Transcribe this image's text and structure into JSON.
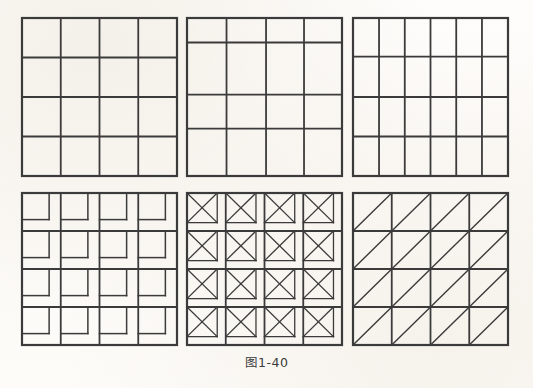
{
  "figure": {
    "caption": "图1-40",
    "background_color": "#fdfcfa",
    "line_color": "#3b3b3b",
    "panel_count": 6
  },
  "panels": [
    {
      "id": "panel-1",
      "name": "uniform-4x4-grid",
      "position": "top-left",
      "x": 22,
      "y": 18,
      "width": 155,
      "height": 158,
      "type": "grid",
      "columns": 4,
      "rows": 4,
      "col_fractions": [
        0.25,
        0.25,
        0.25,
        0.25
      ],
      "row_fractions": [
        0.25,
        0.25,
        0.25,
        0.25
      ],
      "cell_motif": "none",
      "border_width": 2.2,
      "inner_width": 1.8
    },
    {
      "id": "panel-2",
      "name": "irregular-4x4-grid",
      "position": "top-middle",
      "x": 187,
      "y": 18,
      "width": 155,
      "height": 158,
      "type": "grid",
      "columns": 4,
      "rows": 4,
      "col_fractions": [
        0.255,
        0.255,
        0.245,
        0.245
      ],
      "row_fractions": [
        0.155,
        0.33,
        0.215,
        0.3
      ],
      "cell_motif": "none",
      "border_width": 2.2,
      "inner_width": 1.8
    },
    {
      "id": "panel-3",
      "name": "six-column-4-row-grid",
      "position": "top-right",
      "x": 353,
      "y": 18,
      "width": 155,
      "height": 158,
      "type": "grid",
      "columns": 6,
      "rows": 4,
      "col_fractions": [
        0.168,
        0.166,
        0.166,
        0.166,
        0.166,
        0.168
      ],
      "row_fractions": [
        0.245,
        0.255,
        0.25,
        0.25
      ],
      "cell_motif": "none",
      "border_width": 2.2,
      "inner_width": 1.8
    },
    {
      "id": "panel-4",
      "name": "nested-square-spiral-grid",
      "position": "bottom-left",
      "x": 22,
      "y": 193,
      "width": 155,
      "height": 152,
      "type": "grid",
      "columns": 4,
      "rows": 4,
      "col_fractions": [
        0.25,
        0.25,
        0.25,
        0.25
      ],
      "row_fractions": [
        0.25,
        0.25,
        0.25,
        0.25
      ],
      "cell_motif": "inner-square-top-left",
      "motif_inset_ratio": 0.7,
      "border_width": 2.2,
      "inner_width": 1.8,
      "motif_width": 1.5
    },
    {
      "id": "panel-5",
      "name": "crossed-square-grid",
      "position": "bottom-middle",
      "x": 187,
      "y": 193,
      "width": 155,
      "height": 152,
      "type": "grid",
      "columns": 4,
      "rows": 4,
      "col_fractions": [
        0.25,
        0.25,
        0.25,
        0.25
      ],
      "row_fractions": [
        0.25,
        0.25,
        0.25,
        0.25
      ],
      "cell_motif": "inner-square-with-both-diagonals",
      "motif_inset_ratio": 0.78,
      "border_width": 2.2,
      "inner_width": 1.8,
      "motif_width": 1.3
    },
    {
      "id": "panel-6",
      "name": "single-diagonal-grid",
      "position": "bottom-right",
      "x": 353,
      "y": 193,
      "width": 155,
      "height": 152,
      "type": "grid",
      "columns": 4,
      "rows": 4,
      "col_fractions": [
        0.25,
        0.25,
        0.25,
        0.25
      ],
      "row_fractions": [
        0.25,
        0.25,
        0.25,
        0.25
      ],
      "cell_motif": "diagonal-bottom-left-to-top-right",
      "border_width": 2.2,
      "inner_width": 1.8,
      "motif_width": 1.4
    }
  ]
}
